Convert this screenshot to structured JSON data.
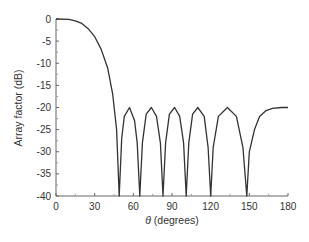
{
  "chart_data": {
    "type": "line",
    "title": "",
    "xlabel_symbol": "θ",
    "xlabel": " (degrees)",
    "ylabel": "Array factor (dB)",
    "xlim": [
      0,
      180
    ],
    "ylim": [
      -40,
      0
    ],
    "xticks": [
      0,
      30,
      60,
      90,
      120,
      150,
      180
    ],
    "yticks": [
      0,
      -5,
      -10,
      -15,
      -20,
      -25,
      -30,
      -35,
      -40
    ],
    "grid": false,
    "legend": null,
    "line_color": "#333333",
    "sidelobe_level_db": -20,
    "nulls_deg": [
      49,
      65,
      83,
      101,
      120,
      148
    ],
    "series": [
      {
        "name": "Array factor",
        "x": [
          0,
          10,
          15,
          20,
          25,
          30,
          35,
          40,
          44,
          47,
          49,
          51,
          53,
          57,
          61,
          63,
          65,
          67,
          70,
          74,
          78,
          81,
          83,
          85,
          88,
          92,
          96,
          99,
          101,
          103,
          106,
          110,
          115,
          118,
          120,
          122,
          126,
          133,
          140,
          145,
          148,
          150,
          154,
          158,
          163,
          168,
          175,
          180
        ],
        "y": [
          0,
          -0.1,
          -0.4,
          -1.0,
          -2.2,
          -4.0,
          -6.8,
          -11.0,
          -17.0,
          -25.0,
          -40,
          -27,
          -22,
          -20,
          -23,
          -28,
          -40,
          -28,
          -21.5,
          -20,
          -22,
          -28,
          -40,
          -28,
          -21.5,
          -20,
          -22,
          -28,
          -40,
          -28,
          -21.5,
          -20,
          -22,
          -29,
          -40,
          -29,
          -22,
          -20,
          -22,
          -29,
          -40,
          -30,
          -25,
          -22,
          -20.7,
          -20.2,
          -20,
          -20
        ]
      }
    ]
  }
}
